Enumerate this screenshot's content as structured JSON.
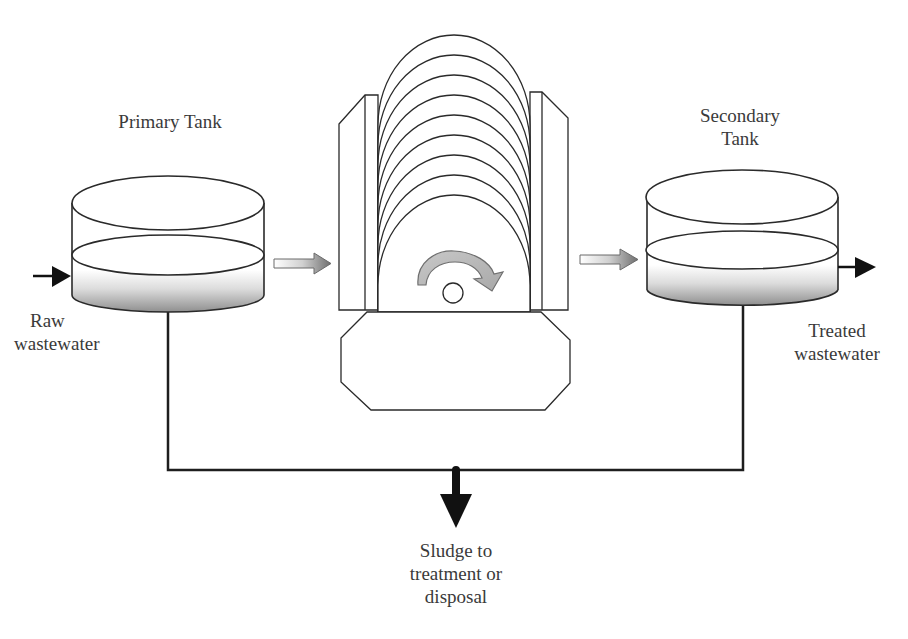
{
  "diagram": {
    "labels": {
      "primary_tank": "Primary Tank",
      "secondary_tank_line1": "Secondary",
      "secondary_tank_line2": "Tank",
      "raw_line1": "Raw",
      "raw_line2": "wastewater",
      "treated_line1": "Treated",
      "treated_line2": "wastewater",
      "sludge_line1": "Sludge to",
      "sludge_line2": "treatment or",
      "sludge_line3": "disposal"
    },
    "components": [
      {
        "id": "primary-tank",
        "type": "cylindrical tank"
      },
      {
        "id": "rbc-unit",
        "type": "rotating biological contactor",
        "disc_count": 9,
        "rotation": "clockwise"
      },
      {
        "id": "secondary-tank",
        "type": "cylindrical tank"
      }
    ],
    "flows": [
      {
        "from": "raw wastewater",
        "to": "primary-tank",
        "style": "black arrow"
      },
      {
        "from": "primary-tank",
        "to": "rbc-unit",
        "style": "gradient arrow"
      },
      {
        "from": "rbc-unit",
        "to": "secondary-tank",
        "style": "gradient arrow"
      },
      {
        "from": "secondary-tank",
        "to": "treated wastewater",
        "style": "black arrow"
      },
      {
        "from": "primary-tank + secondary-tank",
        "to": "sludge treatment or disposal",
        "style": "line + black arrow"
      }
    ],
    "colors": {
      "stroke": "#2a2a2a",
      "text": "#3a3a3a",
      "rotation_arrow_fill": "#b9b9b9",
      "sludge_gradient_dark": "#9a9a9a"
    }
  }
}
